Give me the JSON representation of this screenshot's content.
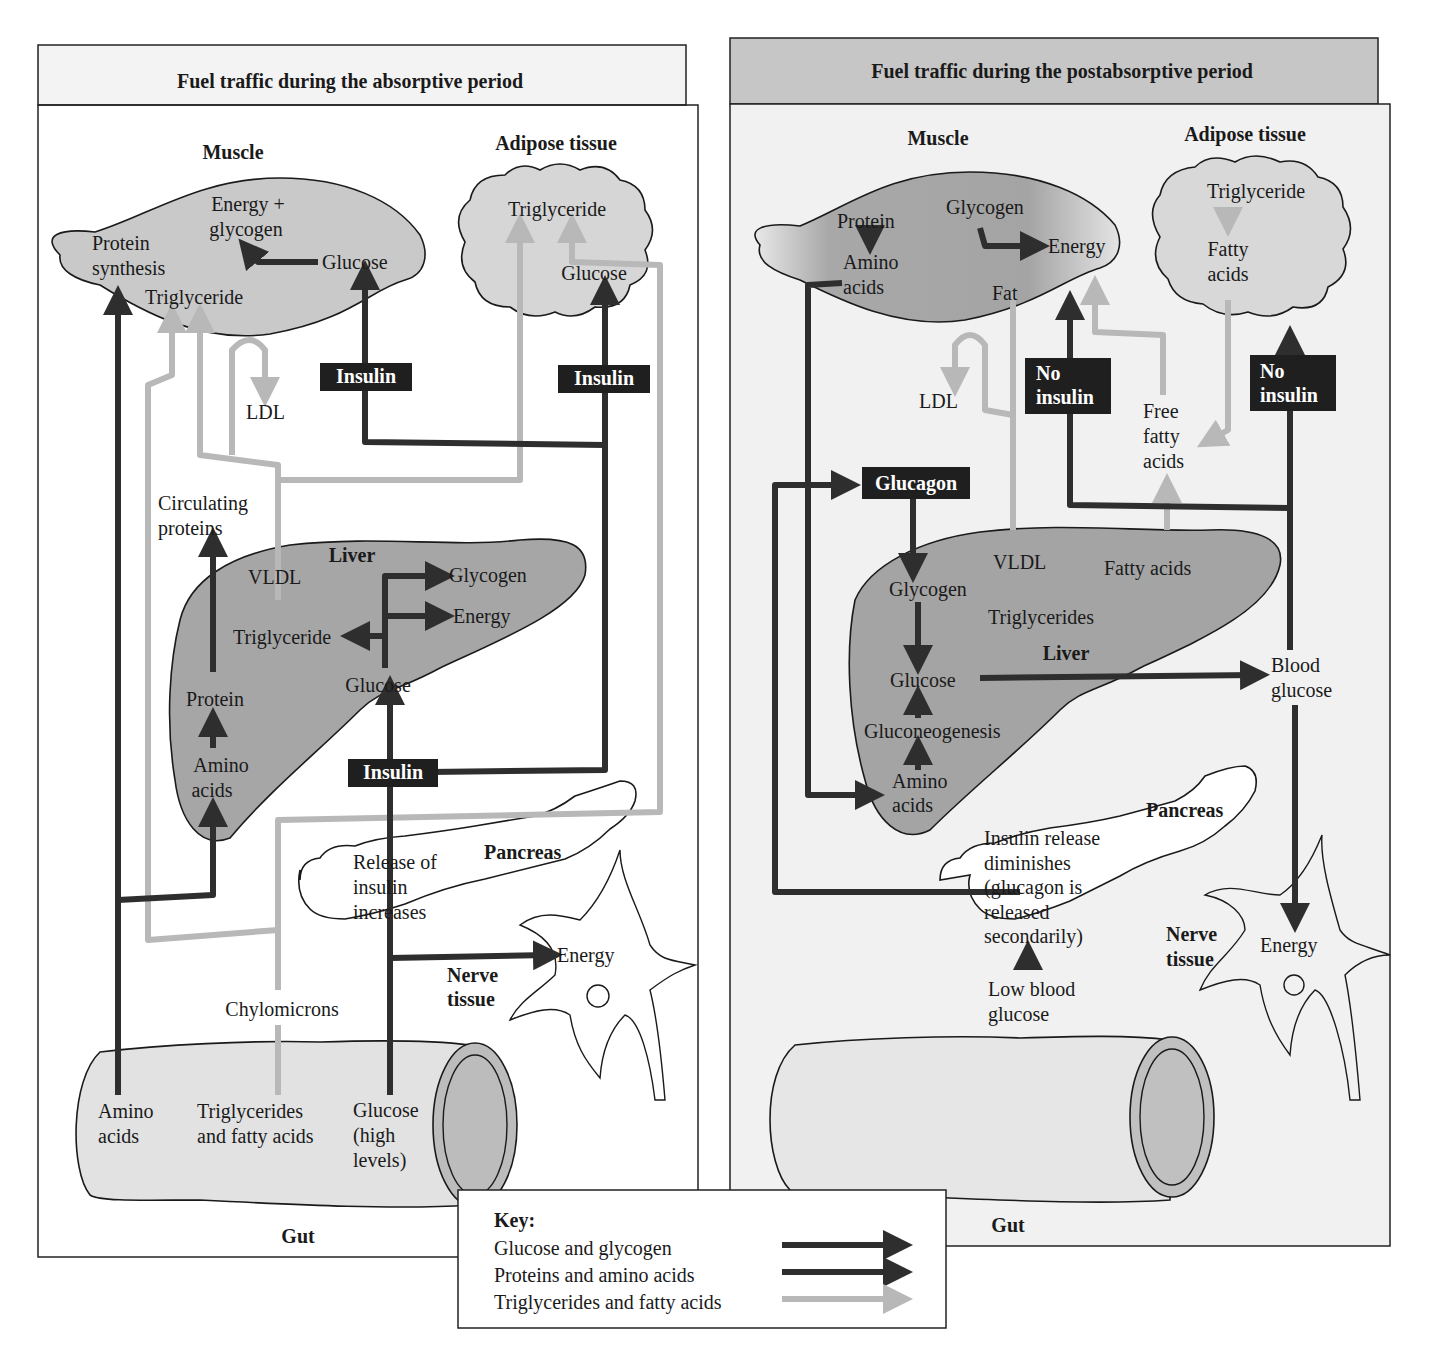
{
  "absorptive": {
    "title": "Fuel traffic during the absorptive period",
    "muscle": {
      "label": "Muscle",
      "energy_glycogen_1": "Energy +",
      "energy_glycogen_2": "glycogen",
      "protein_synthesis_1": "Protein",
      "protein_synthesis_2": "synthesis",
      "glucose": "Glucose",
      "triglyceride": "Triglyceride"
    },
    "adipose": {
      "label": "Adipose tissue",
      "triglyceride": "Triglyceride",
      "glucose": "Glucose"
    },
    "insulin_muscle": "Insulin",
    "insulin_adipose": "Insulin",
    "insulin_liver": "Insulin",
    "ldl": "LDL",
    "circulating_proteins_1": "Circulating",
    "circulating_proteins_2": "proteins",
    "liver": {
      "label": "Liver",
      "vldl": "VLDL",
      "glycogen": "Glycogen",
      "energy": "Energy",
      "triglyceride": "Triglyceride",
      "glucose": "Glucose",
      "protein": "Protein",
      "amino_acids_1": "Amino",
      "amino_acids_2": "acids"
    },
    "pancreas": {
      "label": "Pancreas",
      "text_1": "Release of",
      "text_2": "insulin",
      "text_3": "increases"
    },
    "nerve": {
      "label_1": "Nerve",
      "label_2": "tissue",
      "energy": "Energy"
    },
    "chylomicrons": "Chylomicrons",
    "gut": {
      "label": "Gut",
      "amino_1": "Amino",
      "amino_2": "acids",
      "tg_1": "Triglycerides",
      "tg_2": "and fatty acids",
      "glucose_1": "Glucose",
      "glucose_2": "(high",
      "glucose_3": "levels)"
    }
  },
  "postabsorptive": {
    "title": "Fuel traffic during the postabsorptive period",
    "muscle": {
      "label": "Muscle",
      "protein": "Protein",
      "amino_1": "Amino",
      "amino_2": "acids",
      "glycogen": "Glycogen",
      "energy": "Energy",
      "fat": "Fat"
    },
    "adipose": {
      "label": "Adipose tissue",
      "triglyceride": "Triglyceride",
      "fatty_1": "Fatty",
      "fatty_2": "acids"
    },
    "ldl": "LDL",
    "no_insulin_muscle_1": "No",
    "no_insulin_muscle_2": "insulin",
    "no_insulin_adipose_1": "No",
    "no_insulin_adipose_2": "insulin",
    "free_fatty_1": "Free",
    "free_fatty_2": "fatty",
    "free_fatty_3": "acids",
    "glucagon": "Glucagon",
    "liver": {
      "label": "Liver",
      "vldl": "VLDL",
      "fatty_acids": "Fatty acids",
      "glycogen": "Glycogen",
      "triglycerides": "Triglycerides",
      "glucose": "Glucose",
      "gluconeogenesis": "Gluconeogenesis",
      "amino_1": "Amino",
      "amino_2": "acids"
    },
    "blood_glucose_1": "Blood",
    "blood_glucose_2": "glucose",
    "pancreas": {
      "label": "Pancreas",
      "text_1": "Insulin release",
      "text_2": "diminishes",
      "text_3": "(glucagon is",
      "text_4": "released",
      "text_5": "secondarily)"
    },
    "low_glucose_1": "Low blood",
    "low_glucose_2": "glucose",
    "nerve": {
      "label_1": "Nerve",
      "label_2": "tissue",
      "energy": "Energy"
    },
    "gut": {
      "label": "Gut"
    }
  },
  "key": {
    "title": "Key:",
    "items": [
      {
        "label": "Glucose and glycogen",
        "color": "#3a3a3a"
      },
      {
        "label": "Proteins and amino acids",
        "color": "#1e1e1e"
      },
      {
        "label": "Triglycerides and fatty acids",
        "color": "#b8b8b8"
      }
    ]
  },
  "colors": {
    "dark_arrow": "#2e2e2e",
    "light_arrow": "#b8b8b8",
    "organ_fill_dark": "#9a9a9a",
    "organ_fill_light": "#dcdcdc",
    "label_box": "#1f1f1f"
  }
}
